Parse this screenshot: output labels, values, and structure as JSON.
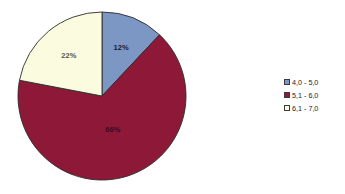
{
  "chart_data": {
    "type": "pie",
    "title": "",
    "subtitle": "",
    "xlabel": "",
    "ylabel": "",
    "grid": false,
    "legend_position": "right",
    "start_angle_deg": 0,
    "direction": "clockwise",
    "categories": [
      "4,0 - 5,0",
      "5,1 - 6,0",
      "6,1 - 7,0"
    ],
    "values": [
      12,
      66,
      22
    ],
    "value_unit": "%",
    "data_labels": [
      "12%",
      "66%",
      "22%"
    ],
    "colors": [
      "#7C97C4",
      "#8E1838",
      "#FBFBDF"
    ],
    "slices": [
      {
        "label": "4,0 - 5,0",
        "value": 12,
        "data_label": "12%",
        "color": "#7C97C4",
        "label_color": "#1a1a33"
      },
      {
        "label": "5,1 - 6,0",
        "value": 66,
        "data_label": "66%",
        "color": "#8E1838",
        "label_color": "#3d0a1c"
      },
      {
        "label": "6,1 - 7,0",
        "value": 22,
        "data_label": "22%",
        "color": "#FBFBDF",
        "label_color": "#55554a"
      }
    ]
  },
  "legend": {
    "items": [
      {
        "label": "4,0 - 5,0",
        "color": "#7C97C4"
      },
      {
        "label": "5,1 - 6,0",
        "color": "#8E1838"
      },
      {
        "label": "6,1 - 7,0",
        "color": "#FBFBDF"
      }
    ]
  },
  "style": {
    "background": "#ffffff",
    "slice_outline": "#2b2b2b",
    "center_x": 102,
    "center_y": 96,
    "radius": 84
  }
}
